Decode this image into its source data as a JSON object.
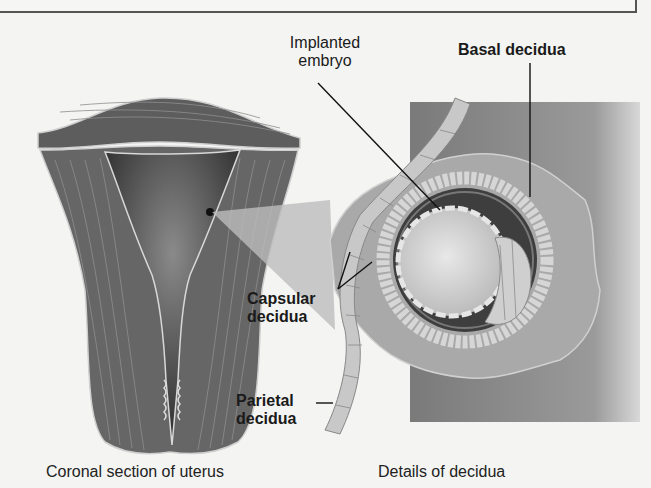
{
  "labels": {
    "implanted_embryo": [
      "Implanted",
      "embryo"
    ],
    "basal_decidua": "Basal decidua",
    "capsular_decidua": [
      "Capsular",
      "decidua"
    ],
    "parietal_decidua": [
      "Parietal",
      "decidua"
    ]
  },
  "captions": {
    "left": "Coronal section of uterus",
    "right": "Details of decidua"
  },
  "colors": {
    "background": "#f4f4f2",
    "muscle": "#6e6e6e",
    "cavity": "#3a3a3a",
    "decidua": "#a8a8a8",
    "text": "#1a1a1a"
  }
}
